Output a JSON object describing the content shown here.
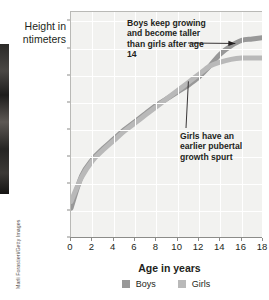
{
  "credit": "Marli Forastieri/Getty Images",
  "axes": {
    "ylabel_line1": "Height in",
    "ylabel_line2": "ntimeters",
    "xlabel": "Age in years"
  },
  "annotations": {
    "boys": "Boys keep growing and become taller than girls after age 14",
    "girls": "Girls have an earlier pubertal growth spurt"
  },
  "legend": {
    "boys_label": "Boys",
    "girls_label": "Girls",
    "boys_color": "#989898",
    "girls_color": "#b9b9b9"
  },
  "chart_data": {
    "type": "line",
    "title": "",
    "xlabel": "Age in years",
    "ylabel": "Height in centimeters",
    "xlim": [
      0,
      18
    ],
    "ylim": [
      30,
      197
    ],
    "xticks": [
      0,
      2,
      4,
      6,
      8,
      10,
      12,
      14,
      16,
      18
    ],
    "yticks": [
      30,
      50,
      70,
      90,
      110,
      130,
      150,
      170,
      190
    ],
    "grid": true,
    "legend_position": "bottom-center",
    "x": [
      0,
      1,
      2,
      3,
      4,
      5,
      6,
      7,
      8,
      9,
      10,
      11,
      12,
      13,
      14,
      15,
      16,
      17,
      18
    ],
    "series": [
      {
        "name": "Boys",
        "color": "#989898",
        "values": [
          52,
          76,
          88,
          96,
          103,
          110,
          116,
          122,
          128,
          133,
          138,
          143,
          149,
          157,
          166,
          172,
          176,
          177,
          178
        ]
      },
      {
        "name": "Girls",
        "color": "#b9b9b9",
        "values": [
          57,
          75,
          87,
          95,
          102,
          109,
          115,
          121,
          127,
          133,
          139,
          145,
          151,
          157,
          160,
          162,
          163,
          163,
          163
        ]
      }
    ],
    "annotations": [
      {
        "text": "Boys keep growing and become taller than girls after age 14",
        "points_to_x": 15.5,
        "points_to_y": 173
      },
      {
        "text": "Girls have an earlier pubertal growth spurt",
        "points_to_x": 11.1,
        "points_to_y": 145
      }
    ]
  }
}
